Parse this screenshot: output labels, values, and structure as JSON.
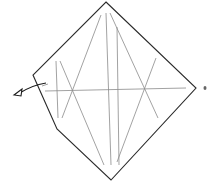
{
  "diagram": {
    "type": "fold-diagram",
    "colors": {
      "outline": "#2a2a2a",
      "crease": "#8a8a8a",
      "arrow": "#1a1a1a",
      "background": "#ffffff"
    },
    "outline_points": "106,2 196,88 111,180 57,129 33,75",
    "creases": [
      {
        "x1": 56,
        "y1": 61,
        "x2": 58,
        "y2": 118
      },
      {
        "x1": 60,
        "y1": 61,
        "x2": 104,
        "y2": 165
      },
      {
        "x1": 101,
        "y1": 15,
        "x2": 62,
        "y2": 118
      },
      {
        "x1": 106,
        "y1": 13,
        "x2": 111,
        "y2": 165
      },
      {
        "x1": 110,
        "y1": 13,
        "x2": 158,
        "y2": 118
      },
      {
        "x1": 117,
        "y1": 27,
        "x2": 119,
        "y2": 165
      },
      {
        "x1": 156,
        "y1": 58,
        "x2": 117,
        "y2": 162
      },
      {
        "x1": 45,
        "y1": 91,
        "x2": 186,
        "y2": 88
      }
    ],
    "arrow": {
      "path": "M 46 83 Q 32 85 18 94",
      "head": "14,95 22,89 21,96"
    },
    "side_mark": {
      "cx": 205,
      "cy": 88
    }
  }
}
